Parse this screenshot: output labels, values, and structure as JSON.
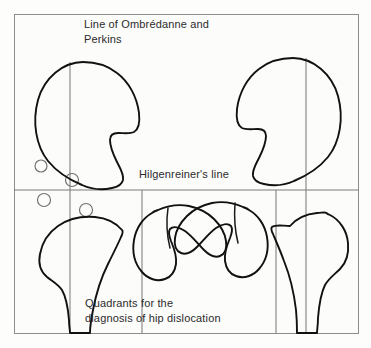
{
  "figure": {
    "title": "Quadrants for the diagnosis of hip dislocation",
    "background_color": "#fdfdfc",
    "frame_color": "#8d8d8d",
    "line_color": "#7b7b7b",
    "bone_color": "#111111",
    "text_color": "#2b2b2b"
  },
  "labels": {
    "ombredanne_line": "Line of Ombrédanne and\nPerkins",
    "hilgenreiner_line": "Hilgenreiner's line",
    "caption": "Quadrants for the\ndiagnosis of hip dislocation"
  },
  "reference_lines": [
    {
      "name": "hilgenreiner-line",
      "orientation": "horizontal",
      "y": 190
    },
    {
      "name": "ombredanne-perkins-line-left",
      "orientation": "vertical",
      "x": 70
    },
    {
      "name": "ombredanne-perkins-line-right",
      "orientation": "vertical",
      "x": 306
    },
    {
      "name": "ombredanne-perkins-line-lower-left",
      "orientation": "vertical",
      "x": 70
    },
    {
      "name": "ombredanne-perkins-line-lower-mid",
      "orientation": "vertical",
      "x": 142
    },
    {
      "name": "ombredanne-perkins-line-lower-right",
      "orientation": "vertical",
      "x": 276
    },
    {
      "name": "ombredanne-perkins-line-lower-far-right",
      "orientation": "vertical",
      "x": 306
    }
  ],
  "quadrant_markers": [
    {
      "name": "quadrant-marker-upper-outer",
      "cx": 41,
      "cy": 166,
      "r": 6
    },
    {
      "name": "quadrant-marker-upper-inner",
      "cx": 72,
      "cy": 180,
      "r": 6.5
    },
    {
      "name": "quadrant-marker-lower-outer",
      "cx": 44,
      "cy": 200,
      "r": 6.5
    },
    {
      "name": "quadrant-marker-lower-inner",
      "cx": 86,
      "cy": 210,
      "r": 6.5
    }
  ],
  "anatomy": [
    {
      "name": "femoral-head-upper-left",
      "description": "normal femoral head above Hilgenreiner's line, left hip"
    },
    {
      "name": "femoral-head-upper-right",
      "description": "normal femoral head above Hilgenreiner's line, right hip"
    },
    {
      "name": "proximal-femur-lower-outer-left",
      "description": "proximal femur shaft, lower left"
    },
    {
      "name": "dislocated-hip-lower-inner-left",
      "description": "dislocated hip outline, lower left inner"
    },
    {
      "name": "dislocated-hip-lower-inner-right",
      "description": "dislocated hip outline, lower right inner"
    },
    {
      "name": "proximal-femur-lower-outer-right",
      "description": "proximal femur shaft, lower right"
    }
  ]
}
